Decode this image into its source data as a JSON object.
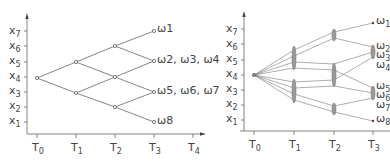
{
  "left_panel": {
    "y_labels": [
      {
        "base": "x",
        "sub": "7"
      },
      {
        "base": "x",
        "sub": "6"
      },
      {
        "base": "x",
        "sub": "5"
      },
      {
        "base": "x",
        "sub": "4"
      },
      {
        "base": "x",
        "sub": "3"
      },
      {
        "base": "x",
        "sub": "2"
      },
      {
        "base": "x",
        "sub": "1"
      }
    ],
    "x_labels": [
      {
        "base": "T",
        "sub": "0"
      },
      {
        "base": "T",
        "sub": "1"
      },
      {
        "base": "T",
        "sub": "2"
      },
      {
        "base": "T",
        "sub": "3"
      },
      {
        "base": "T",
        "sub": "4"
      }
    ],
    "outcome_labels": [
      "ω1",
      "ω2, ω3, ω4",
      "ω5, ω6, ω7",
      "ω8"
    ]
  },
  "right_panel": {
    "y_labels": [
      {
        "base": "x",
        "sub": "7"
      },
      {
        "base": "x",
        "sub": "6"
      },
      {
        "base": "x",
        "sub": "5"
      },
      {
        "base": "x",
        "sub": "4"
      },
      {
        "base": "x",
        "sub": "3"
      },
      {
        "base": "x",
        "sub": "2"
      },
      {
        "base": "x",
        "sub": "1"
      }
    ],
    "x_labels": [
      {
        "base": "T",
        "sub": "0"
      },
      {
        "base": "T",
        "sub": "1"
      },
      {
        "base": "T",
        "sub": "2"
      },
      {
        "base": "T",
        "sub": "3"
      }
    ],
    "outcome_labels": [
      {
        "base": "ω",
        "sub": "1"
      },
      {
        "base": "ω",
        "sub": "2"
      },
      {
        "base": "ω",
        "sub": "3"
      },
      {
        "base": "ω",
        "sub": "4"
      },
      {
        "base": "ω",
        "sub": "5"
      },
      {
        "base": "ω",
        "sub": "6"
      },
      {
        "base": "ω",
        "sub": "7"
      },
      {
        "base": "ω",
        "sub": "8"
      }
    ]
  },
  "colors": {
    "line": "#666666",
    "text": "#444444",
    "ellipse_fill": "#9a9a9a"
  }
}
